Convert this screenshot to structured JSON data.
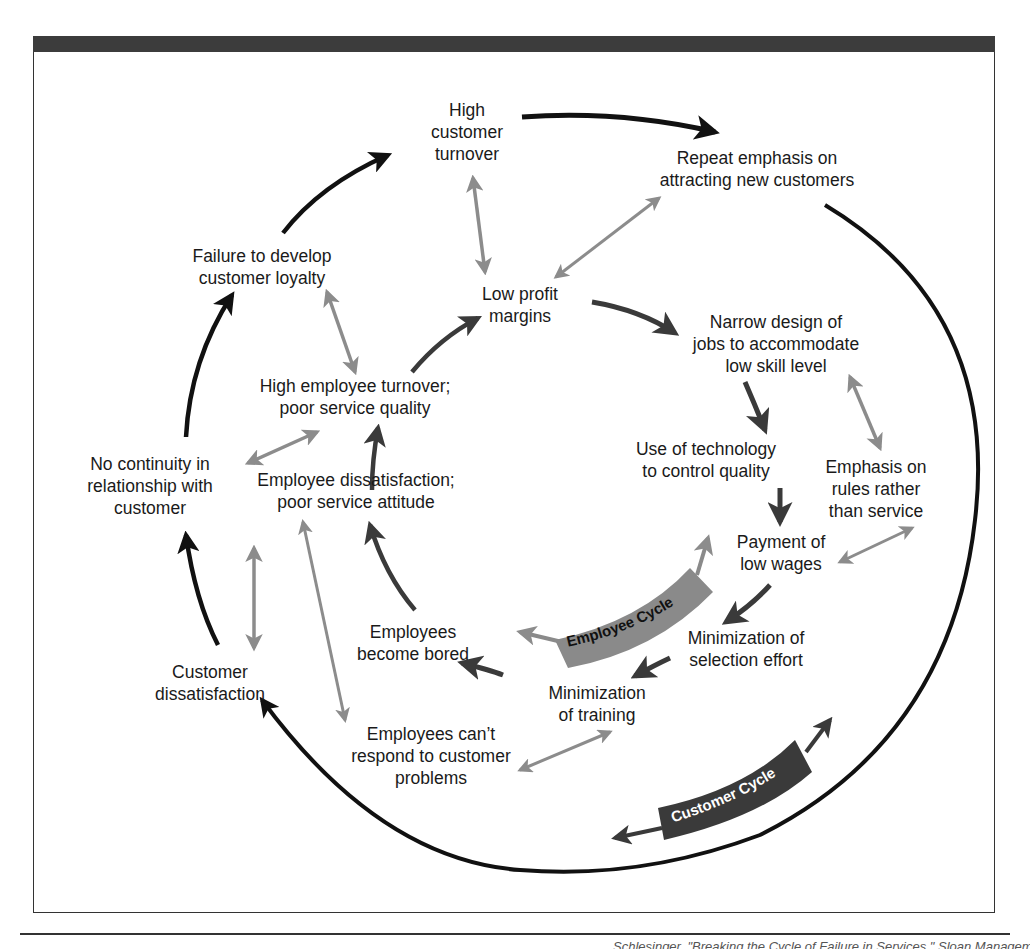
{
  "figure": {
    "footer_fragment": "…Schlesinger, \"Breaking the Cycle of Failure in Services,\" Sloan Management Review, 31 (spring"
  },
  "colors": {
    "outer_arrow": "#111111",
    "inner_arrow": "#3a3a3a",
    "link_arrow": "#8c8c8c",
    "employee_band": "#8a8a8a",
    "customer_band": "#3a3a3a",
    "header_bar": "#3c3c3c"
  },
  "cycles": {
    "employee": "Employee Cycle",
    "customer": "Customer Cycle"
  },
  "nodes": {
    "high_customer_turnover": [
      "High",
      "customer",
      "turnover"
    ],
    "repeat_emphasis": [
      "Repeat emphasis on",
      "attracting new customers"
    ],
    "failure_loyalty": [
      "Failure to develop",
      "customer loyalty"
    ],
    "low_profit": [
      "Low profit",
      "margins"
    ],
    "narrow_design": [
      "Narrow design of",
      "jobs to accommodate",
      "low skill level"
    ],
    "high_employee_turnover": [
      "High employee turnover;",
      "poor service quality"
    ],
    "use_technology": [
      "Use of technology",
      "to control quality"
    ],
    "emphasis_rules": [
      "Emphasis on",
      "rules rather",
      "than service"
    ],
    "no_continuity": [
      "No continuity in",
      "relationship with",
      "customer"
    ],
    "employee_dissatisfaction": [
      "Employee dissatisfaction;",
      "poor service attitude"
    ],
    "payment_low_wages": [
      "Payment of",
      "low wages"
    ],
    "employees_bored": [
      "Employees",
      "become bored"
    ],
    "min_selection": [
      "Minimization of",
      "selection effort"
    ],
    "customer_dissatisfaction": [
      "Customer",
      "dissatisfaction"
    ],
    "min_training": [
      "Minimization",
      "of training"
    ],
    "employees_cant_respond": [
      "Employees can’t",
      "respond to customer",
      "problems"
    ]
  }
}
